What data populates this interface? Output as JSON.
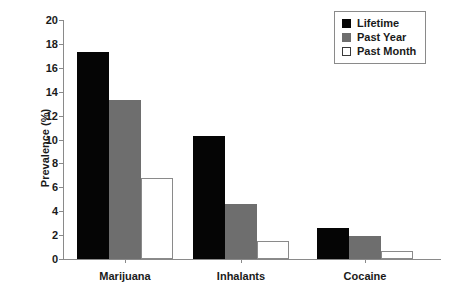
{
  "chart_data": {
    "type": "bar",
    "title": "",
    "subtitle": "",
    "xlabel": "",
    "ylabel": "Prevalence (%)",
    "ylim": [
      0,
      20
    ],
    "ytick_step": 2,
    "yticks": [
      "20",
      "18",
      "16",
      "14",
      "12",
      "10",
      "8",
      "6",
      "4",
      "2",
      "0"
    ],
    "grid": false,
    "legend_position": "top-right",
    "categories": [
      "Marijuana",
      "Inhalants",
      "Cocaine"
    ],
    "series": [
      {
        "name": "Lifetime",
        "color": "#050505",
        "values": [
          17.3,
          10.3,
          2.6
        ]
      },
      {
        "name": "Past Year",
        "color": "#6e6e6e",
        "values": [
          13.3,
          4.6,
          1.9
        ]
      },
      {
        "name": "Past Month",
        "color": "#ffffff",
        "values": [
          6.8,
          1.5,
          0.7
        ]
      }
    ]
  },
  "legend": {
    "items": [
      {
        "label": "Lifetime",
        "swatch": "black-square-icon"
      },
      {
        "label": "Past Year",
        "swatch": "gray-square-icon"
      },
      {
        "label": "Past Month",
        "swatch": "white-square-icon"
      }
    ]
  },
  "axes": {
    "y_title": "Prevalence (%)"
  }
}
